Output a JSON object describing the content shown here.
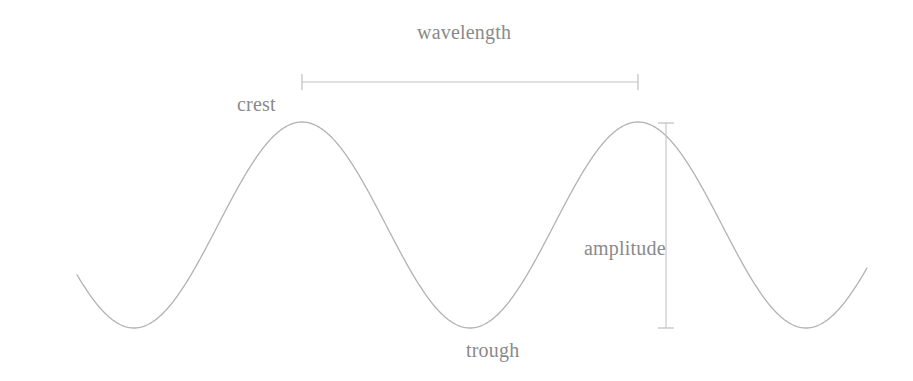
{
  "figure": {
    "background_color": "#ffffff",
    "curve_color": "#b2b2b2",
    "label_color": "#8a8a8a",
    "measure_color": "#c0c0c0"
  },
  "labels": {
    "wavelength": "wavelength",
    "crest": "crest",
    "trough": "trough",
    "amplitude": "amplitude"
  },
  "chart_data": {
    "type": "line",
    "title": "",
    "xlabel": "",
    "ylabel": "",
    "grid": false,
    "legend": "none",
    "xlim": [
      77,
      867
    ],
    "ylim": [
      122,
      328
    ],
    "annotations": [
      {
        "name": "wavelength",
        "text": "wavelength",
        "kind": "horizontal-measure",
        "x_start": 302,
        "x_end": 638,
        "y": 82,
        "length_px": 336
      },
      {
        "name": "amplitude",
        "text": "amplitude",
        "kind": "vertical-measure",
        "x": 666,
        "y_start": 123,
        "y_end": 328,
        "length_px": 205
      },
      {
        "name": "crest",
        "text": "crest",
        "kind": "point-label",
        "x": 302,
        "y": 122
      },
      {
        "name": "trough",
        "text": "trough",
        "kind": "point-label",
        "x": 470,
        "y": 328
      }
    ],
    "wave": {
      "equation": "y = midline - amp * cos(2*pi*(x - x_trough)/wavelength)",
      "midline_y": 225,
      "amplitude_px": 103,
      "wavelength_px": 336,
      "crest_y": 122,
      "trough_y": 328,
      "crests_x": [
        302,
        638
      ],
      "troughs_x": [
        134,
        470,
        806
      ],
      "x_start": 77,
      "x_end": 867
    },
    "points": [
      {
        "x": 77,
        "y": 235
      },
      {
        "x": 106,
        "y": 291
      },
      {
        "x": 134,
        "y": 328
      },
      {
        "x": 162,
        "y": 319
      },
      {
        "x": 190,
        "y": 277
      },
      {
        "x": 218,
        "y": 225
      },
      {
        "x": 246,
        "y": 173
      },
      {
        "x": 274,
        "y": 131
      },
      {
        "x": 302,
        "y": 122
      },
      {
        "x": 330,
        "y": 131
      },
      {
        "x": 358,
        "y": 173
      },
      {
        "x": 386,
        "y": 225
      },
      {
        "x": 414,
        "y": 277
      },
      {
        "x": 442,
        "y": 319
      },
      {
        "x": 470,
        "y": 328
      },
      {
        "x": 498,
        "y": 319
      },
      {
        "x": 526,
        "y": 277
      },
      {
        "x": 554,
        "y": 225
      },
      {
        "x": 582,
        "y": 173
      },
      {
        "x": 610,
        "y": 131
      },
      {
        "x": 638,
        "y": 122
      },
      {
        "x": 666,
        "y": 131
      },
      {
        "x": 694,
        "y": 173
      },
      {
        "x": 722,
        "y": 225
      },
      {
        "x": 750,
        "y": 277
      },
      {
        "x": 778,
        "y": 319
      },
      {
        "x": 806,
        "y": 328
      },
      {
        "x": 834,
        "y": 296
      },
      {
        "x": 867,
        "y": 233
      }
    ]
  }
}
